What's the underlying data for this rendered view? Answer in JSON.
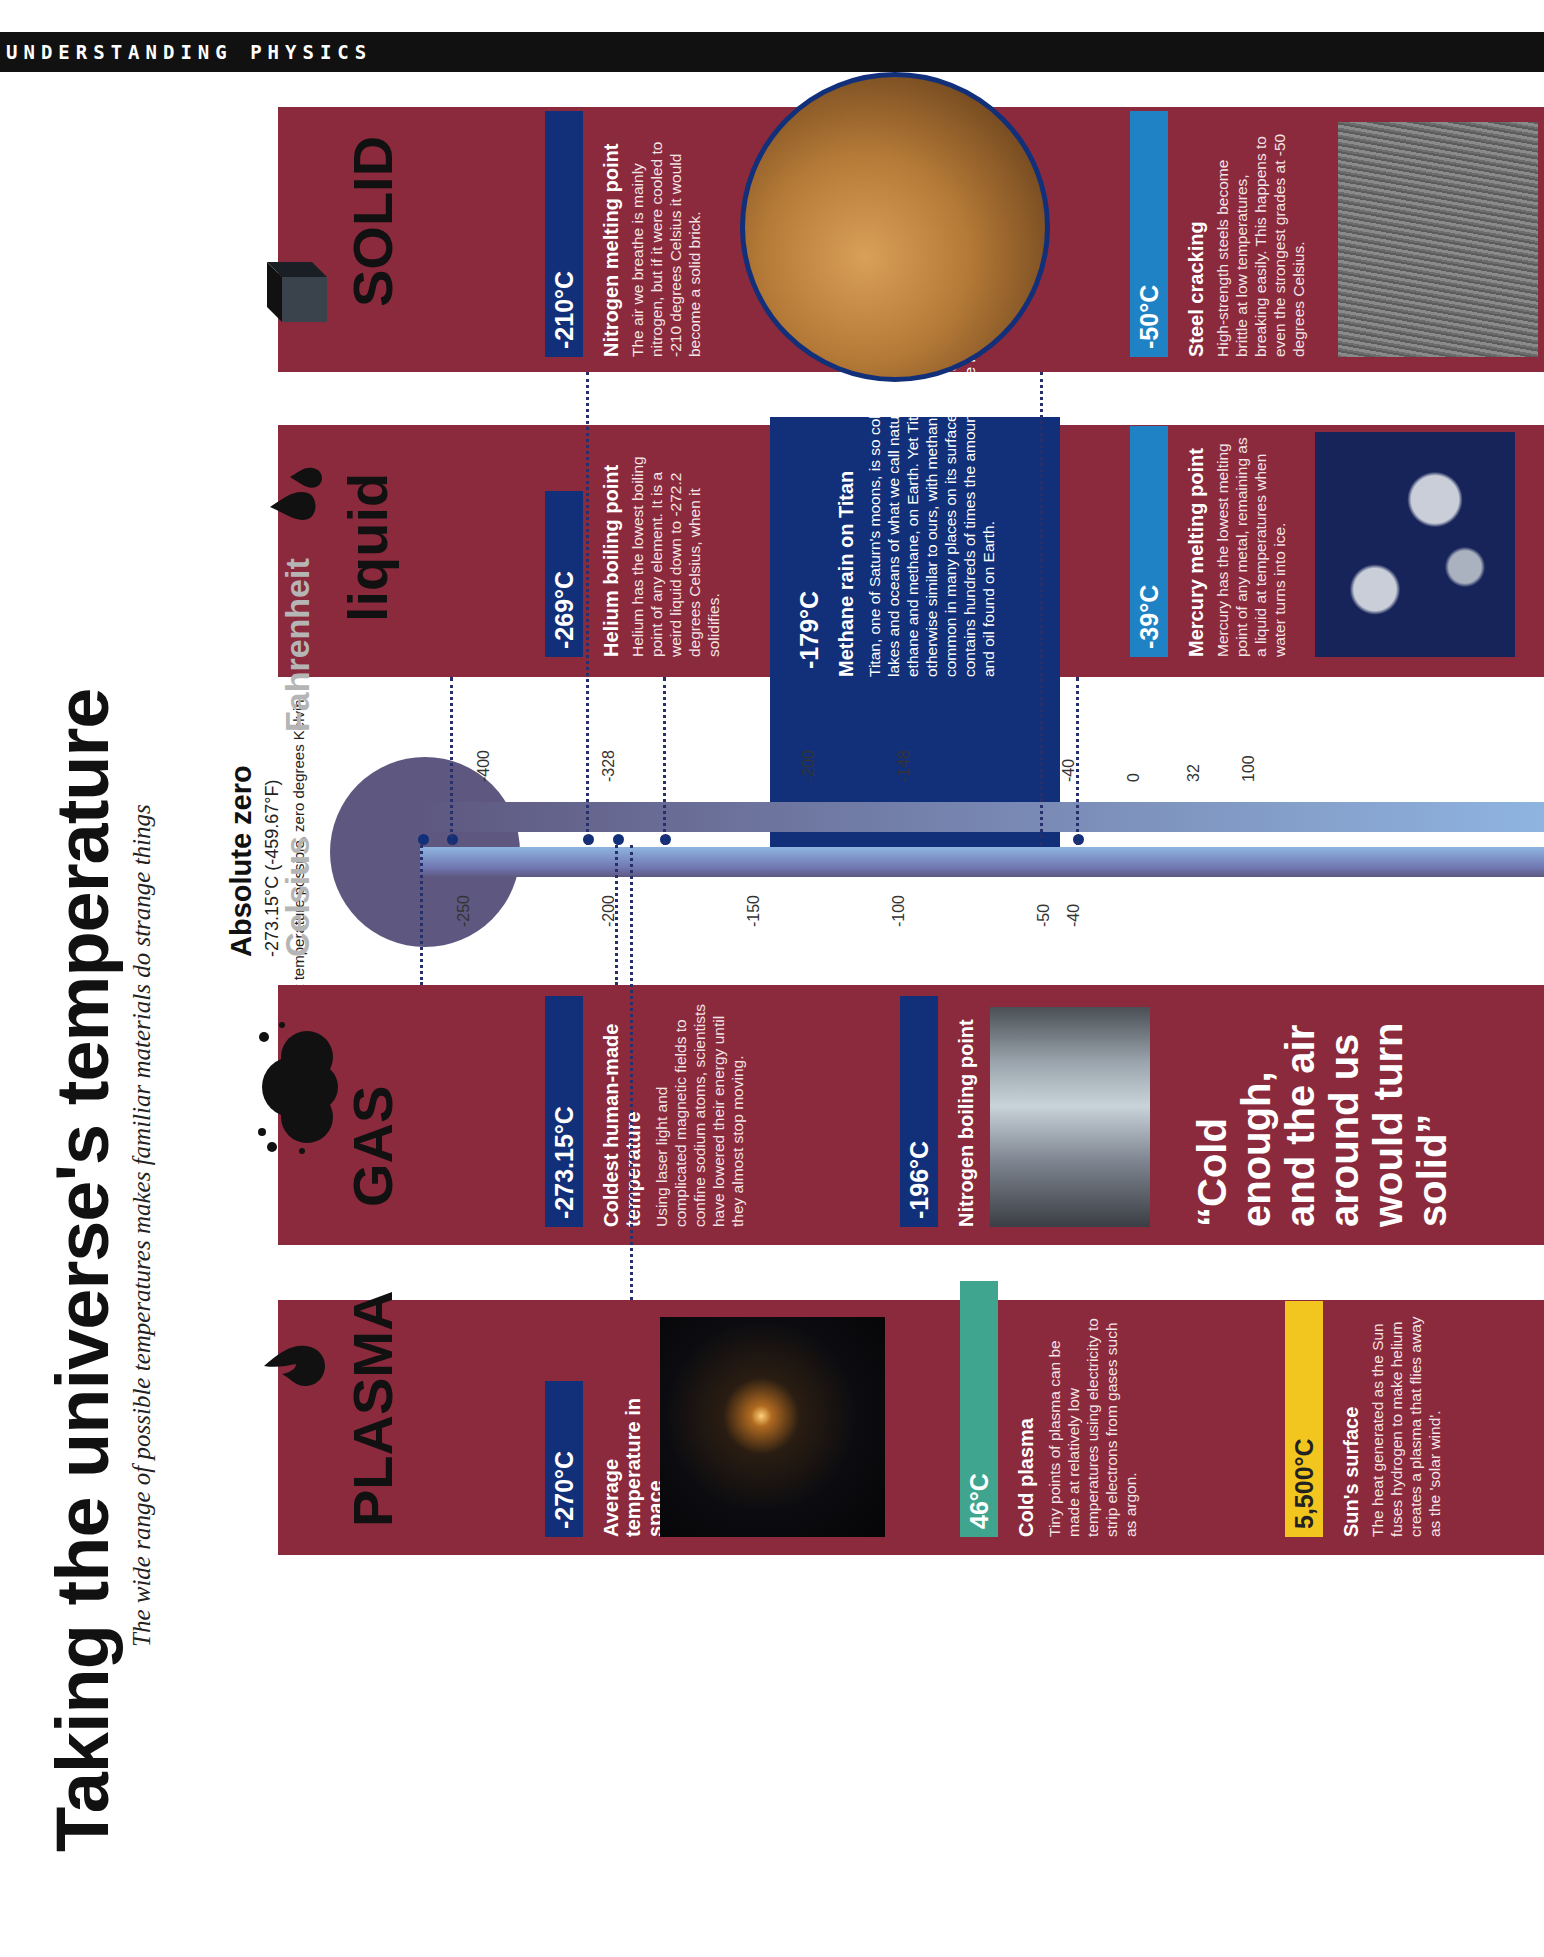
{
  "header": {
    "section": "UNDERSTANDING PHYSICS"
  },
  "article": {
    "title": "Taking the universe's temperature",
    "subtitle": "The wide range of possible temperatures makes familiar materials do strange things"
  },
  "absolute_zero": {
    "title": "Absolute zero",
    "value": "-273.15°C (-459.67°F)",
    "note": "The lowest temperature possible, zero degrees Kelvin."
  },
  "thermometer": {
    "fahrenheit_label": "Fahrenheit",
    "celsius_label": "Celsius",
    "fahrenheit_ticks": [
      "-400",
      "-328",
      "-200",
      "-148",
      "-40",
      "0",
      "32",
      "100"
    ],
    "celsius_ticks": [
      "-250",
      "-200",
      "-150",
      "-100",
      "-50",
      "-40"
    ]
  },
  "phases": {
    "plasma": {
      "label": "PLASMA",
      "icon": "flame-icon"
    },
    "gas": {
      "label": "GAS",
      "icon": "cloud-icon"
    },
    "liquid": {
      "label": "liquid",
      "icon": "droplets-icon"
    },
    "solid": {
      "label": "SOLID",
      "icon": "cube-icon"
    }
  },
  "facts": {
    "space": {
      "temp": "-270°C",
      "title": "Average temperature in space"
    },
    "cold_plasma": {
      "temp": "46°C",
      "title": "Cold plasma",
      "body": "Tiny points of plasma can be made at relatively low temperatures using electricity to strip electrons from gases such as argon."
    },
    "sun": {
      "temp": "5,500°C",
      "title": "Sun's surface",
      "body": "The heat generated as the Sun fuses hydrogen to make helium creates a plasma that flies away as the 'solar wind'."
    },
    "coldest_human": {
      "temp": "-273.15°C",
      "title": "Coldest human-made temperature",
      "body": "Using laser light and complicated magnetic fields to confine sodium atoms, scientists have lowered their energy until they almost stop moving."
    },
    "nitrogen_boil": {
      "temp": "-196°C",
      "title": "Nitrogen boiling point"
    },
    "helium_boil": {
      "temp": "-269°C",
      "title": "Helium boiling point",
      "body": "Helium has the lowest boiling point of any element. It is a weird liquid down to -272.2 degrees Celsius, when it solidifies."
    },
    "methane_titan": {
      "temp": "-179°C",
      "title": "Methane rain on Titan",
      "body": "Titan, one of Saturn's moons, is so cold it is covered in lakes and oceans of what we call natural gases, such as ethane and methane, on Earth. Yet Titan's weather seems otherwise similar to ours, with methane and ethane rain common in many places on its surface. Overall, Titan contains hundreds of times the amount of the natural gas and oil found on Earth."
    },
    "mercury_melt": {
      "temp": "-39°C",
      "title": "Mercury melting point",
      "body": "Mercury has the lowest melting point of any metal, remaining as a liquid at temperatures when water turns into ice."
    },
    "nitrogen_melt": {
      "temp": "-210°C",
      "title": "Nitrogen melting point",
      "body": "The air we breathe is mainly nitrogen, but if it were cooled to -210 degrees Celsius it would become a solid brick."
    },
    "steel": {
      "temp": "-50°C",
      "title": "Steel cracking",
      "body": "High-strength steels become brittle at low temperatures, breaking easily. This happens to even the strongest grades at -50 degrees Celsius."
    }
  },
  "quote": "“Cold enough, and the air around us would turn solid”",
  "colors": {
    "panel": "#8c2a3d",
    "navy": "#12307a",
    "blue": "#1f82c4",
    "teal": "#3fa58e",
    "yellow": "#f2c61f"
  }
}
